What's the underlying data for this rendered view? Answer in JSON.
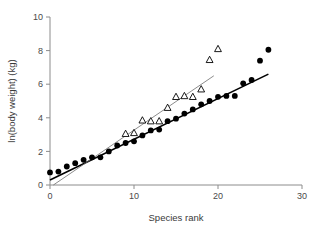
{
  "chart_data": {
    "type": "scatter",
    "title": "",
    "xlabel": "Species rank",
    "ylabel": "ln(body weight) (kg)",
    "xlim": [
      0,
      30
    ],
    "ylim": [
      0,
      10
    ],
    "xticks": [
      0,
      10,
      20,
      30
    ],
    "yticks": [
      0,
      2,
      4,
      6,
      8,
      10
    ],
    "xtick_labels": [
      "0",
      "10",
      "20",
      "30"
    ],
    "ytick_labels": [
      "0",
      "2",
      "4",
      "6",
      "8",
      "10"
    ],
    "grid": false,
    "legend": "none",
    "series": [
      {
        "name": "filled-circles",
        "marker": "circle",
        "marker_fill": "#000000",
        "x": [
          0,
          1,
          2,
          3,
          4,
          5,
          6,
          7,
          8,
          9,
          10,
          11,
          12,
          13,
          14,
          15,
          16,
          17,
          18,
          19,
          20,
          21,
          22,
          23,
          24,
          25,
          26
        ],
        "y": [
          0.75,
          0.8,
          1.1,
          1.3,
          1.5,
          1.65,
          1.65,
          2.0,
          2.35,
          2.5,
          2.6,
          2.95,
          3.25,
          3.3,
          3.8,
          3.95,
          4.25,
          4.5,
          4.8,
          5.0,
          5.25,
          5.3,
          5.3,
          6.05,
          6.25,
          7.4,
          8.05
        ]
      },
      {
        "name": "open-triangles",
        "marker": "triangle",
        "marker_fill": "#ffffff",
        "x": [
          9,
          10,
          11,
          12,
          13,
          14,
          15,
          16,
          17,
          18,
          19,
          20
        ],
        "y": [
          3.05,
          3.1,
          3.85,
          3.8,
          3.8,
          4.6,
          5.25,
          5.3,
          5.25,
          5.7,
          7.45,
          8.1
        ]
      }
    ],
    "fit_lines": [
      {
        "name": "circles-regression",
        "style": "thick-black",
        "x0": 0.0,
        "y0": 0.3,
        "x1": 26.0,
        "y1": 6.6
      },
      {
        "name": "triangles-regression",
        "style": "thin-grey",
        "x0": 0.4,
        "y0": 0.0,
        "x1": 19.5,
        "y1": 6.5
      }
    ]
  },
  "figure": {
    "caption": ""
  }
}
